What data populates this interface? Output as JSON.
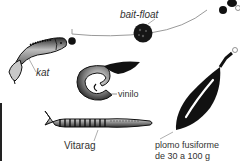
{
  "diagram": {
    "labels": {
      "bait_float": "bait-float",
      "kat": "kat",
      "vinilo": "vinilo",
      "vitarag": "Vitarag",
      "plomo_line1": "plomo fusiforme",
      "plomo_line2": "de 30 a 100 g"
    },
    "colors": {
      "ink": "#111111",
      "line": "#9a9a9a",
      "text": "#333333",
      "background": "#ffffff"
    }
  }
}
